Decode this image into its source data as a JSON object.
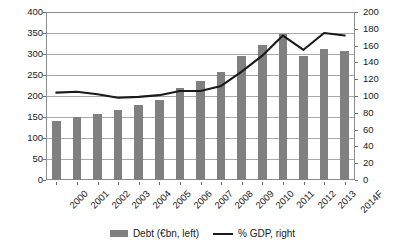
{
  "chart_data": {
    "type": "bar",
    "title": "",
    "subtitle": "",
    "xlabel": "",
    "ylabel": "",
    "grid": true,
    "legend_position": "bottom",
    "categories": [
      "2000",
      "2001",
      "2002",
      "2003",
      "2004",
      "2005",
      "2006",
      "2007",
      "2008",
      "2009",
      "2010",
      "2011",
      "2012",
      "2013",
      "2014F"
    ],
    "axes": {
      "left": {
        "label": "Debt (€bn)",
        "min": 0,
        "max": 400,
        "step": 50,
        "ticks": [
          "0",
          "50",
          "100",
          "150",
          "200",
          "250",
          "300",
          "350",
          "400"
        ]
      },
      "right": {
        "label": "% GDP",
        "min": 0,
        "max": 200,
        "step": 20,
        "ticks": [
          "0",
          "20",
          "40",
          "60",
          "80",
          "100",
          "120",
          "140",
          "160",
          "180",
          "200"
        ]
      }
    },
    "series": [
      {
        "name": "Debt (€bn, left)",
        "type": "bar",
        "axis": "left",
        "color": "#808080",
        "values": [
          140,
          150,
          158,
          166,
          179,
          191,
          219,
          235,
          258,
          295,
          322,
          348,
          295,
          311,
          308
        ]
      },
      {
        "name": "% GDP, right",
        "type": "line",
        "axis": "right",
        "color": "#1a1a1a",
        "values": [
          104,
          105,
          102,
          98,
          99,
          101,
          106,
          106,
          112,
          129,
          148,
          172,
          155,
          175,
          172
        ]
      }
    ]
  },
  "legend": {
    "entries": [
      {
        "label": "Debt (€bn, left)",
        "marker": "bar-swatch"
      },
      {
        "label": "% GDP, right",
        "marker": "line-swatch"
      }
    ]
  }
}
